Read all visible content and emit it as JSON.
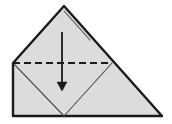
{
  "figure": {
    "name": "origami-fold-step",
    "background_color": "#ffffff",
    "paper_fill_color": "#dcdcdc",
    "outline_color": "#1a1a1a",
    "crease_color": "#4d4d4d",
    "fold_line_color": "#1a1a1a",
    "arrow_color": "#1a1a1a"
  },
  "shape": {
    "name": "folded-paper-outline",
    "apex": {
      "x": 64,
      "y": 6
    },
    "left_shoulder": {
      "x": 13,
      "y": 63
    },
    "bottom_left": {
      "x": 13,
      "y": 116
    },
    "bottom_right": {
      "x": 162,
      "y": 116
    },
    "outline_points": "64,6 13,63 13,116 162,116",
    "outline_width": 2.4
  },
  "layer_edge": {
    "name": "top-layer-edge",
    "points": "64,11 90,40",
    "width": 1.1
  },
  "fold_line": {
    "name": "valley-fold-crease",
    "type": "dashed",
    "start": {
      "x": 13,
      "y": 63
    },
    "end": {
      "x": 112,
      "y": 63
    },
    "y": 63,
    "dash_pattern": "7,4",
    "width": 2.2
  },
  "crease_left": {
    "name": "left-flap-crease",
    "points": "13,63 64,116",
    "width": 1.1
  },
  "crease_right": {
    "name": "right-flap-crease",
    "points": "112,63 64,116",
    "width": 1.1
  },
  "arrow": {
    "name": "fold-direction-arrow",
    "direction": "down",
    "x": 62,
    "shaft_top_y": 32,
    "shaft_bottom_y": 83,
    "tip_y": 91,
    "head_half_width": 5,
    "shaft_width": 1.8,
    "head_points": "57,82 67,82 62,91"
  }
}
